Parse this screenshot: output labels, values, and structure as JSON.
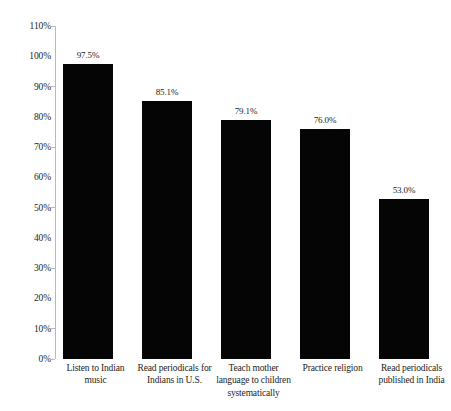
{
  "chart_data": {
    "type": "bar",
    "title": "",
    "subtitle": "",
    "xlabel": "",
    "ylabel": "",
    "ylim": [
      0,
      110
    ],
    "grid": false,
    "legend": false,
    "orientation": "vertical",
    "bar_color": "#050505",
    "axis_color": "#b9b9bb",
    "background": "#ffffff",
    "categories": [
      "Listen to Indian music",
      "Read periodicals for Indians in U.S.",
      "Teach mother language to children systematically",
      "Practice religion",
      "Read periodicals published in India"
    ],
    "category_lines": [
      [
        "Listen to Indian",
        "music"
      ],
      [
        "Read periodicals for",
        "Indians in U.S."
      ],
      [
        "Teach mother",
        "language to children",
        "systematically"
      ],
      [
        "Practice religion"
      ],
      [
        "Read periodicals",
        "published in India"
      ]
    ],
    "values": [
      97.5,
      85.1,
      79.1,
      76.0,
      53.0
    ],
    "value_labels": [
      "97.5%",
      "85.1%",
      "79.1%",
      "76.0%",
      "53.0%"
    ],
    "yticks": [
      110,
      100,
      90,
      80,
      70,
      60,
      50,
      40,
      30,
      20,
      10,
      0
    ],
    "ytick_labels": [
      "110%",
      "100%",
      "90%",
      "80%",
      "70%",
      "60%",
      "50%",
      "40%",
      "30%",
      "20%",
      "10%",
      "0%"
    ],
    "ytick_has_mark": [
      true,
      false,
      true,
      false,
      true,
      false,
      true,
      false,
      true,
      false,
      true,
      true
    ]
  }
}
